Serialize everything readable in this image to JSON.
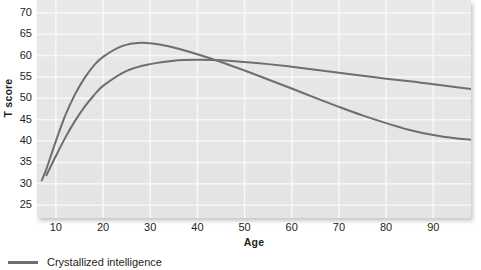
{
  "chart_data": {
    "type": "line",
    "title": "",
    "xlabel": "Age",
    "ylabel": "T score",
    "xlim": [
      6,
      98
    ],
    "ylim": [
      22,
      73
    ],
    "grid": true,
    "legend_position": "bottom-left",
    "x_ticks": [
      10,
      20,
      30,
      40,
      50,
      60,
      70,
      80,
      90
    ],
    "x_tick_labels": [
      "10",
      "20",
      "30",
      "40",
      "50",
      "60",
      "70",
      "80",
      "90"
    ],
    "y_ticks": [
      70,
      65,
      60,
      55,
      50,
      45,
      40,
      35,
      30,
      25
    ],
    "y_tick_labels": [
      "70",
      "65",
      "60",
      "55",
      "50",
      "45",
      "40",
      "35",
      "30",
      "25"
    ],
    "series": [
      {
        "name": "Crystallized intelligence",
        "color": "#6e6e6e",
        "x": [
          8,
          10,
          12,
          14,
          16,
          18,
          20,
          25,
          30,
          35,
          40,
          45,
          50,
          55,
          60,
          65,
          70,
          75,
          80,
          85,
          90,
          95,
          98
        ],
        "values": [
          32.0,
          36.5,
          40.8,
          44.6,
          47.9,
          50.6,
          52.9,
          56.4,
          58.0,
          58.8,
          59.0,
          58.9,
          58.5,
          58.0,
          57.4,
          56.7,
          56.0,
          55.3,
          54.6,
          54.0,
          53.3,
          52.6,
          52.2
        ]
      },
      {
        "name": "Fluid intelligence",
        "color": "#6e6e6e",
        "x": [
          7,
          8,
          10,
          12,
          14,
          16,
          18,
          20,
          24,
          28,
          32,
          36,
          40,
          45,
          50,
          55,
          60,
          65,
          70,
          75,
          80,
          85,
          90,
          95,
          98
        ],
        "values": [
          30.8,
          33.5,
          40.0,
          46.0,
          50.8,
          54.6,
          57.6,
          59.7,
          62.2,
          63.0,
          62.6,
          61.6,
          60.3,
          58.5,
          56.5,
          54.4,
          52.3,
          50.1,
          48.0,
          46.0,
          44.2,
          42.6,
          41.4,
          40.6,
          40.3
        ]
      }
    ],
    "legend": [
      {
        "label": "Crystallized intelligence",
        "color": "#6e6e6e"
      }
    ]
  },
  "axes": {
    "y_title": "T score",
    "x_title": "Age"
  }
}
